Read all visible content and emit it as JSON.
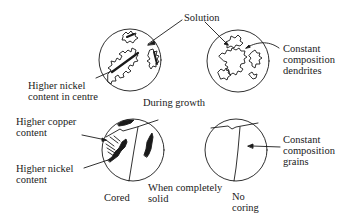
{
  "diagram": {
    "stages": [
      {
        "id": "during-growth",
        "caption": "During growth",
        "panels": [
          {
            "id": "cored-growth",
            "annotations": [
              {
                "id": "higher-nickel-centre",
                "lines": [
                  "Higher nickel",
                  "content in centre"
                ]
              },
              {
                "id": "solution-left",
                "lines": [
                  "Solution"
                ]
              }
            ]
          },
          {
            "id": "uniform-growth",
            "annotations": [
              {
                "id": "solution-right",
                "lines": [
                  "Solution"
                ]
              },
              {
                "id": "constant-dendrites",
                "lines": [
                  "Constant",
                  "composition",
                  "dendrites"
                ]
              }
            ]
          }
        ]
      },
      {
        "id": "when-solid",
        "caption_lines": [
          "When completely",
          "solid"
        ],
        "panels": [
          {
            "id": "cored-solid",
            "caption": "Cored",
            "annotations": [
              {
                "id": "higher-copper",
                "lines": [
                  "Higher copper",
                  "content"
                ]
              },
              {
                "id": "higher-nickel",
                "lines": [
                  "Higher nickel",
                  "content"
                ]
              }
            ]
          },
          {
            "id": "no-coring-solid",
            "caption_lines": [
              "No",
              "coring"
            ],
            "annotations": [
              {
                "id": "constant-grains",
                "lines": [
                  "Constant",
                  "composition",
                  "grains"
                ]
              }
            ]
          }
        ]
      }
    ],
    "colors": {
      "ink": "#1a1a1a",
      "background": "#ffffff"
    }
  }
}
